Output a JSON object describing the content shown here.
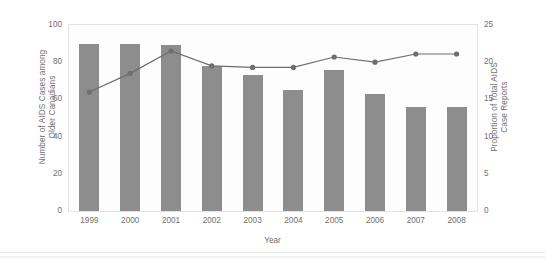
{
  "chart_data": {
    "type": "bar",
    "title": "",
    "xlabel": "Year",
    "ylabel": "Number of AIDS Cases among Older Canadians",
    "ylabel_right": "Proportion of Total AIDS Case Reports",
    "categories": [
      "1999",
      "2000",
      "2001",
      "2002",
      "2003",
      "2004",
      "2005",
      "2006",
      "2007",
      "2008"
    ],
    "ylim": [
      0,
      100
    ],
    "yticks": [
      "0",
      "20",
      "40",
      "60",
      "80",
      "100"
    ],
    "ytick_values": [
      0,
      20,
      40,
      60,
      80,
      100
    ],
    "ylim_right": [
      0,
      25
    ],
    "yticks_right": [
      "0",
      "5",
      "10",
      "15",
      "20",
      "25"
    ],
    "ytick_right_values": [
      0,
      5,
      10,
      15,
      20,
      25
    ],
    "grid": false,
    "legend": "none",
    "series": [
      {
        "name": "Number of AIDS Cases among Older Canadians",
        "type": "bar",
        "axis": "left",
        "color": "#8d8d8d",
        "values": [
          90,
          90,
          89,
          78,
          73,
          65,
          76,
          63,
          56,
          56
        ]
      },
      {
        "name": "Proportion of Total AIDS Case Reports",
        "type": "line",
        "axis": "right",
        "color": "#6e6e6e",
        "values": [
          16.0,
          18.5,
          21.5,
          19.5,
          19.3,
          19.3,
          20.7,
          20.0,
          21.1,
          21.1
        ]
      }
    ]
  }
}
